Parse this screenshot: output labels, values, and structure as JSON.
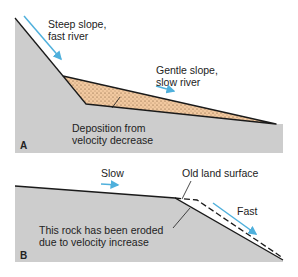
{
  "panel_a": {
    "letter": "A",
    "steep_label_1": "Steep slope,",
    "steep_label_2": "fast river",
    "gentle_label_1": "Gentle slope,",
    "gentle_label_2": "slow river",
    "deposit_label_1": "Deposition from",
    "deposit_label_2": "velocity decrease"
  },
  "panel_b": {
    "letter": "B",
    "slow_label": "Slow",
    "old_surface_label": "Old land surface",
    "fast_label": "Fast",
    "eroded_label_1": "This rock has been eroded",
    "eroded_label_2": "due to velocity increase"
  },
  "colors": {
    "rock": "#cdcdcd",
    "deposit": "#f2c9a0",
    "arrow": "#4fb0dc",
    "line": "#1a1a1a"
  }
}
